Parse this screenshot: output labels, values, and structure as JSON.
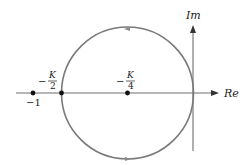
{
  "diagram": {
    "type": "nyquist-plot",
    "axes": {
      "real_label": "Re",
      "imag_label": "Im"
    },
    "points": [
      {
        "id": "minus-one",
        "label": "−1"
      },
      {
        "id": "minus-k-half",
        "sign": "−",
        "numerator": "K",
        "denominator": "2"
      },
      {
        "id": "minus-k-quarter",
        "sign": "−",
        "numerator": "K",
        "denominator": "4"
      }
    ],
    "circle": {
      "description": "Nyquist locus circle centered at −K/4 passing through origin and −K/2"
    },
    "colors": {
      "curve": "#7a7a7a",
      "axes": "#6e6e6e",
      "points": "#111111",
      "text": "#222222"
    }
  }
}
